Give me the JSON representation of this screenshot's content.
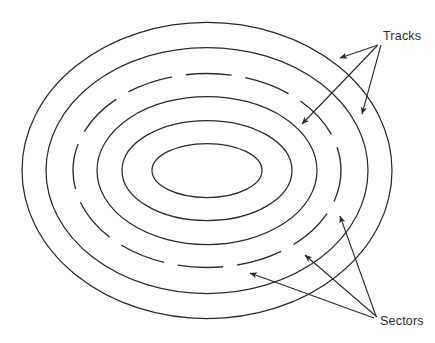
{
  "figure": {
    "name": "disk-platter-tracks-sectors",
    "background_color": "#ffffff",
    "stroke_color": "#2b2b2b",
    "width": 435,
    "height": 343
  },
  "labels": {
    "tracks": {
      "text": "Tracks",
      "x": 383,
      "y": 40,
      "anchor": "start"
    },
    "sectors": {
      "text": "Sectors",
      "x": 380,
      "y": 325,
      "anchor": "start"
    }
  },
  "chart_data": {
    "type": "diagram",
    "title": "",
    "center": {
      "cx": 207,
      "cy": 170.5
    },
    "rings": [
      {
        "id": "ring-1-outer",
        "rx": 185,
        "ry": 148,
        "dashed": false
      },
      {
        "id": "ring-2",
        "rx": 161,
        "ry": 123,
        "dashed": false
      },
      {
        "id": "ring-3-dashed",
        "rx": 134,
        "ry": 97,
        "dashed": true
      },
      {
        "id": "ring-4",
        "rx": 110,
        "ry": 74,
        "dashed": false
      },
      {
        "id": "ring-5",
        "rx": 85,
        "ry": 50,
        "dashed": false
      },
      {
        "id": "ring-6-inner",
        "rx": 55,
        "ry": 27,
        "dashed": false
      }
    ],
    "dash_pattern": "46 14",
    "leaders": [
      {
        "from_label": "tracks",
        "x1": 378,
        "y1": 45,
        "x2": 338,
        "y2": 57
      },
      {
        "from_label": "tracks",
        "x1": 381,
        "y1": 45,
        "x2": 360,
        "y2": 113
      },
      {
        "from_label": "tracks",
        "x1": 377,
        "y1": 46,
        "x2": 300,
        "y2": 123
      },
      {
        "from_label": "sectors",
        "x1": 376,
        "y1": 316,
        "x2": 339,
        "y2": 214
      },
      {
        "from_label": "sectors",
        "x1": 377,
        "y1": 317,
        "x2": 303,
        "y2": 253
      },
      {
        "from_label": "sectors",
        "x1": 374,
        "y1": 318,
        "x2": 248,
        "y2": 272
      }
    ],
    "legend": [],
    "xlabel": "",
    "ylabel": ""
  }
}
